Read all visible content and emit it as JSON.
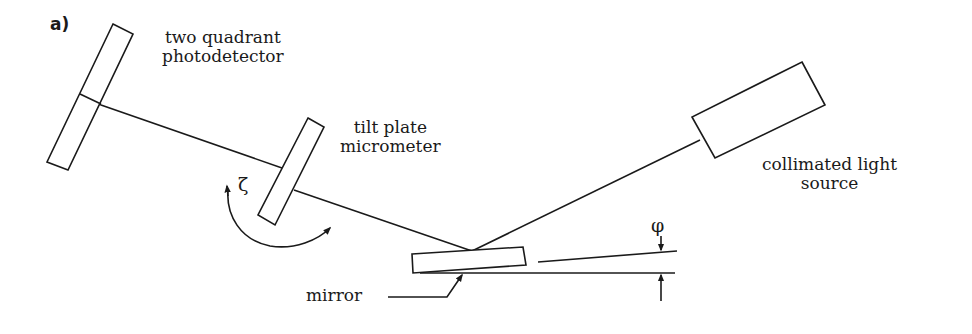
{
  "figure": {
    "panel_label": "a)",
    "labels": {
      "photodetector": [
        "two quadrant",
        "photodetector"
      ],
      "tilt_plate": [
        "tilt plate",
        "micrometer"
      ],
      "light_source": [
        "collimated light",
        "source"
      ],
      "mirror": "mirror"
    },
    "symbols": {
      "rotation_angle": "ζ",
      "tilt_angle": "φ"
    },
    "colors": {
      "stroke": "#1a1a1a",
      "background": "#ffffff"
    }
  }
}
